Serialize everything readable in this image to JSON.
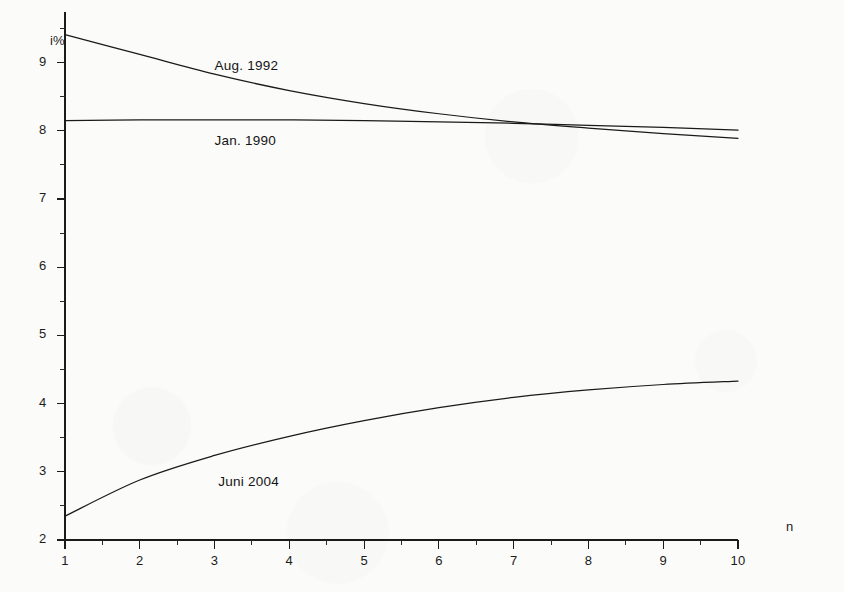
{
  "figure": {
    "background_color": "#fbfbf9",
    "ink_color": "#1a1a1a",
    "y_axis_title": "i%",
    "x_axis_title": "n"
  },
  "chart_data": {
    "type": "line",
    "title": "",
    "subtitle": "",
    "xlabel": "n",
    "ylabel": "i%",
    "xlim": [
      1,
      10
    ],
    "ylim": [
      2,
      9.7
    ],
    "grid": false,
    "legend_position": "inline-labels",
    "x_ticks": [
      1,
      2,
      3,
      4,
      5,
      6,
      7,
      8,
      9,
      10
    ],
    "x_tick_labels": [
      "1",
      "2",
      "3",
      "4",
      "5",
      "6",
      "7",
      "8",
      "9",
      "10"
    ],
    "x_minor_ticks": [
      1.5,
      2.5,
      3.5,
      4.5,
      5.5,
      6.5,
      7.5,
      8.5,
      9.5
    ],
    "y_ticks": [
      2,
      3,
      4,
      5,
      6,
      7,
      8,
      9
    ],
    "y_tick_labels": [
      "2",
      "3",
      "4",
      "5",
      "6",
      "7",
      "8",
      "9"
    ],
    "y_minor_ticks": [
      2.5,
      3.5,
      4.5,
      5.5,
      6.5,
      7.5,
      8.5,
      9.5
    ],
    "x": [
      1,
      2,
      3,
      4,
      5,
      6,
      7,
      8,
      9,
      10
    ],
    "series": [
      {
        "name": "Aug. 1992",
        "label": "Aug. 1992",
        "label_x": 3.0,
        "label_y": 8.93,
        "values": [
          9.41,
          9.12,
          8.83,
          8.59,
          8.4,
          8.25,
          8.13,
          8.04,
          7.96,
          7.89
        ]
      },
      {
        "name": "Jan. 1990",
        "label": "Jan. 1990",
        "label_x": 3.0,
        "label_y": 7.84,
        "values": [
          8.15,
          8.16,
          8.16,
          8.16,
          8.15,
          8.13,
          8.11,
          8.08,
          8.05,
          8.01
        ]
      },
      {
        "name": "Juni 2004",
        "label": "Juni 2004",
        "label_x": 3.05,
        "label_y": 2.83,
        "values": [
          2.35,
          2.88,
          3.24,
          3.52,
          3.75,
          3.94,
          4.09,
          4.2,
          4.28,
          4.33
        ]
      }
    ]
  }
}
